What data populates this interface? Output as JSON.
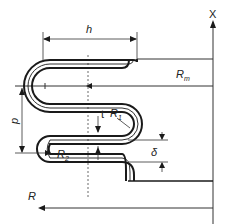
{
  "diagram": {
    "type": "bellows corrugation cross-section",
    "labels": {
      "axis": "X",
      "height": "h",
      "mean_radius": "R",
      "mean_radius_sub": "m",
      "pitch": "p",
      "thickness": "t",
      "crest_radius": "R",
      "crest_radius_sub": "1",
      "root_radius": "R",
      "root_radius_sub": "2",
      "gap": "δ",
      "radius": "R"
    },
    "colors": {
      "stroke": "#1a1a1a",
      "thin": "#333333",
      "background": "#ffffff"
    }
  }
}
